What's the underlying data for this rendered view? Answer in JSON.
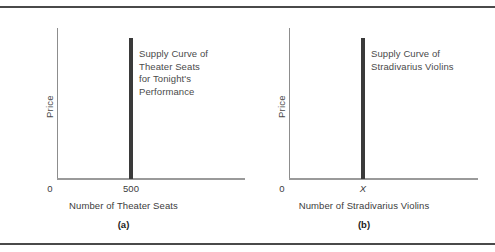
{
  "figure": {
    "panels": [
      {
        "id": "a",
        "caption": "(a)",
        "y_axis_title": "Price",
        "x_axis_title": "Number of Theater Seats",
        "origin_label": "0",
        "quantity_label": "500",
        "curve_label_lines": [
          "Supply Curve of",
          "Theater Seats",
          "for Tonight's",
          "Performance"
        ]
      },
      {
        "id": "b",
        "caption": "(b)",
        "y_axis_title": "Price",
        "x_axis_title": "Number of Stradivarius Violins",
        "origin_label": "0",
        "quantity_label": "X",
        "curve_label_lines": [
          "Supply Curve of",
          "Stradivarius Violins"
        ]
      }
    ]
  },
  "chart_data": [
    {
      "type": "line",
      "title": "Supply Curve of Theater Seats for Tonight's Performance",
      "xlabel": "Number of Theater Seats",
      "ylabel": "Price",
      "series": [
        {
          "name": "Supply Curve of Theater Seats for Tonight's Performance",
          "x": [
            500,
            500
          ],
          "y": [
            0,
            100
          ]
        }
      ],
      "xticks": [
        "0",
        "500"
      ],
      "yticks": [],
      "xlim": [
        0,
        1300
      ],
      "ylim": [
        0,
        107
      ],
      "grid": false,
      "legend": "none",
      "annotations": [
        "Supply Curve of Theater Seats for Tonight's Performance"
      ],
      "note": "Perfectly inelastic (vertical) supply at quantity 500"
    },
    {
      "type": "line",
      "title": "Supply Curve of Stradivarius Violins",
      "xlabel": "Number of Stradivarius Violins",
      "ylabel": "Price",
      "series": [
        {
          "name": "Supply Curve of Stradivarius Violins",
          "x": [
            "X",
            "X"
          ],
          "y": [
            0,
            100
          ]
        }
      ],
      "xticks": [
        "0",
        "X"
      ],
      "yticks": [],
      "xlim": [
        0,
        1300
      ],
      "ylim": [
        0,
        107
      ],
      "grid": false,
      "legend": "none",
      "annotations": [
        "Supply Curve of Stradivarius Violins"
      ],
      "note": "Perfectly inelastic (vertical) supply at fixed quantity X"
    }
  ]
}
